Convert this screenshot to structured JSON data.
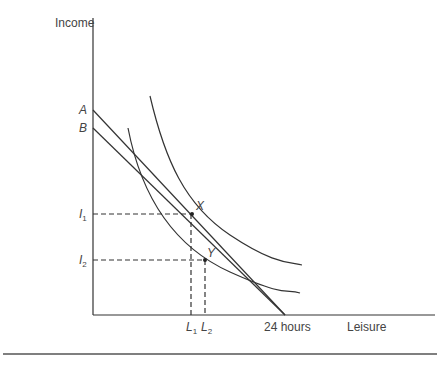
{
  "axes": {
    "y_label": "Income",
    "x_label": "Leisure",
    "x_end_label": "24 hours"
  },
  "points": {
    "A": "A",
    "B": "B",
    "X": "X",
    "Y": "Y"
  },
  "y_ticks": [
    {
      "base": "I",
      "sub": "1"
    },
    {
      "base": "I",
      "sub": "2"
    }
  ],
  "x_ticks": [
    {
      "base": "L",
      "sub": "1"
    },
    {
      "base": "L",
      "sub": "2"
    }
  ],
  "colors": {
    "line": "#333333"
  }
}
